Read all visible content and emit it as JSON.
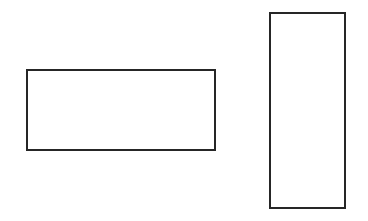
{
  "canvas": {
    "width": 368,
    "height": 221,
    "background_color": "#ffffff",
    "description": "line-drawing figure of two unfilled rectangles"
  },
  "style": {
    "stroke_color": "#262626",
    "stroke_width": 2,
    "fill_color": "none"
  },
  "shapes": [
    {
      "name": "landscape-rectangle",
      "orientation": "horizontal",
      "label": "",
      "x": 26,
      "y": 69,
      "width": 190,
      "height": 82,
      "stroke_color": "#262626",
      "stroke_width": 2,
      "fill_color": "none"
    },
    {
      "name": "portrait-rectangle",
      "orientation": "vertical",
      "label": "",
      "x": 269,
      "y": 12,
      "width": 77,
      "height": 197,
      "stroke_color": "#262626",
      "stroke_width": 2,
      "fill_color": "none"
    }
  ]
}
